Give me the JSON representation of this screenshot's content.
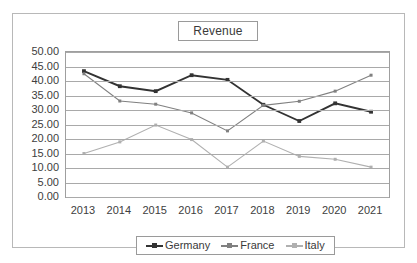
{
  "chart_data": {
    "type": "line",
    "title": "Revenue",
    "xlabel": "",
    "ylabel": "",
    "categories": [
      "2013",
      "2014",
      "2015",
      "2016",
      "2017",
      "2018",
      "2019",
      "2020",
      "2021"
    ],
    "series": [
      {
        "name": "Germany",
        "color": "#333333",
        "marker": "diamond",
        "values": [
          43.4,
          38.2,
          36.5,
          42.0,
          40.4,
          31.8,
          26.2,
          32.3,
          29.4
        ]
      },
      {
        "name": "France",
        "color": "#808080",
        "marker": "diamond",
        "values": [
          42.5,
          33.1,
          32.0,
          29.0,
          22.8,
          31.6,
          33.0,
          36.5,
          42.0
        ]
      },
      {
        "name": "Italy",
        "color": "#b0b0b0",
        "marker": "diamond",
        "values": [
          15.0,
          19.0,
          24.8,
          19.8,
          10.3,
          19.3,
          14.0,
          13.0,
          10.3
        ]
      }
    ],
    "ylim": [
      0,
      50
    ],
    "ystep": 5,
    "yticks": [
      "0.00",
      "5.00",
      "10.00",
      "15.00",
      "20.00",
      "25.00",
      "30.00",
      "35.00",
      "40.00",
      "45.00",
      "50.00"
    ],
    "grid": true,
    "legend_position": "bottom"
  }
}
